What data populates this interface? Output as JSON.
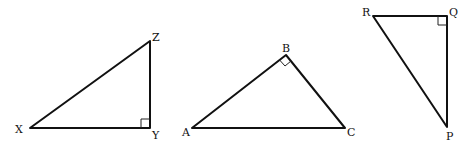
{
  "figure": {
    "triangles": [
      {
        "name": "XYZ",
        "right_angle_at": "Y",
        "vertices": [
          {
            "label": "X",
            "x": 30,
            "y": 128
          },
          {
            "label": "Y",
            "x": 150,
            "y": 128
          },
          {
            "label": "Z",
            "x": 150,
            "y": 41
          }
        ]
      },
      {
        "name": "ABC",
        "right_angle_at": "B",
        "vertices": [
          {
            "label": "A",
            "x": 192,
            "y": 128
          },
          {
            "label": "B",
            "x": 286,
            "y": 55
          },
          {
            "label": "C",
            "x": 345,
            "y": 128
          }
        ]
      },
      {
        "name": "PQR",
        "right_angle_at": "Q",
        "vertices": [
          {
            "label": "R",
            "x": 373,
            "y": 16
          },
          {
            "label": "Q",
            "x": 447,
            "y": 16
          },
          {
            "label": "P",
            "x": 447,
            "y": 127
          }
        ]
      }
    ]
  }
}
